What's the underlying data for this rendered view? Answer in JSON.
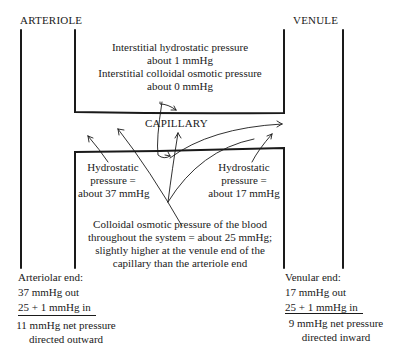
{
  "vessels": {
    "arteriole_label": "ARTERIOLE",
    "venule_label": "VENULE",
    "capillary_label": "CAPILLARY"
  },
  "interstitial": {
    "hydrostatic_line1": "Interstitial hydrostatic pressure",
    "hydrostatic_line2": "about  1  mmHg",
    "osmotic_line1": "Interstitial  colloidal osmotic pressure",
    "osmotic_line2": "about  0  mmHg"
  },
  "hydrostatic_arterial": {
    "line1": "Hydrostatic",
    "line2": "pressure =",
    "line3": "about 37 mmHg"
  },
  "hydrostatic_venous": {
    "line1": "Hydrostatic",
    "line2": "pressure =",
    "line3": "about 17 mmHg"
  },
  "blood_osmotic": {
    "line1": "Colloidal osmotic pressure of the blood",
    "line2": "throughout the system = about 25 mmHg;",
    "line3": "slightly higher at the venule end of the",
    "line4": "capillary than the arteriole end"
  },
  "arteriolar_end": {
    "title": "Arteriolar end:",
    "out": "37 mmHg out",
    "in": "25 + 1 mmHg in",
    "net1": "11 mmHg net pressure",
    "net2": "directed outward"
  },
  "venular_end": {
    "title": "Venular end:",
    "out": "17 mmHg out",
    "in": "25 + 1 mmHg in",
    "net1": "9 mmHg net pressure",
    "net2": "directed inward"
  },
  "colors": {
    "ink": "#1a1a1a",
    "background": "#ffffff"
  }
}
